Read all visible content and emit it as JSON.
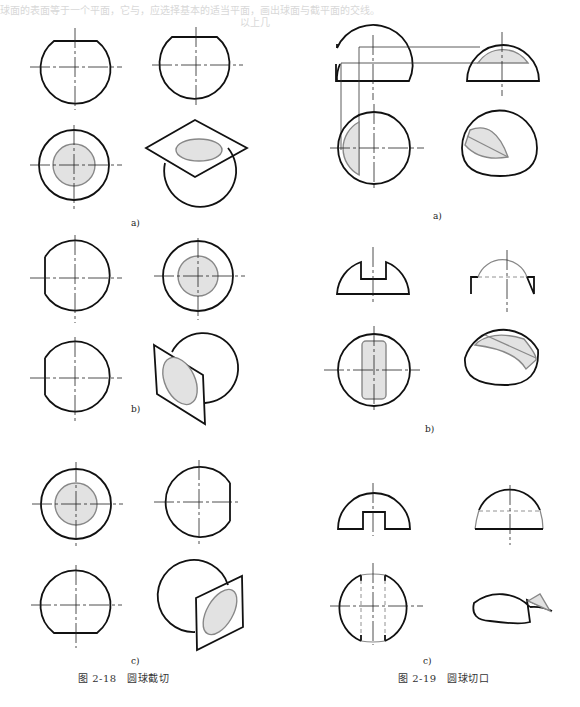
{
  "page": {
    "bleed_through_lines": [
      "球面的表面等于一个平面，它与，应选择基本的适当平面，画出球面与截平面的交线。",
      "以上几",
      "绘制截切球面时，根据截平面与投影面的相对位置，可以得到圆、直线或椭圆。"
    ]
  },
  "figure_2_18": {
    "caption": "图 2-18　圆球截切",
    "subfigures": [
      {
        "label": "a)"
      },
      {
        "label": "b)"
      },
      {
        "label": "c)"
      }
    ]
  },
  "figure_2_19": {
    "caption": "图 2-19　圆球切口",
    "subfigures": [
      {
        "label": "a)"
      },
      {
        "label": "b)"
      },
      {
        "label": "c)"
      }
    ]
  },
  "colors": {
    "outline": "#111111",
    "section_fill": "#e2e2e2",
    "section_stroke": "#888888",
    "bleed_text": "#d8d8d8"
  }
}
